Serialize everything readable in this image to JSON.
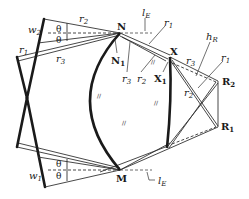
{
  "diagram": {
    "type": "geometric-construction",
    "colors": {
      "ink": "#1a1a1a",
      "thin": "#333333",
      "dashed": "#444444",
      "background": "#ffffff"
    },
    "points": {
      "N": {
        "label": "N",
        "x": 120,
        "y": 33
      },
      "N1": {
        "label": "N",
        "sub": "1",
        "x": 116,
        "y": 36
      },
      "M": {
        "label": "M",
        "x": 120,
        "y": 170
      },
      "X": {
        "label": "X",
        "x": 170,
        "y": 57
      },
      "X1": {
        "label": "X",
        "sub": "1",
        "x": 168,
        "y": 62
      },
      "R1": {
        "label": "R",
        "sub": "1",
        "x": 218,
        "y": 127
      },
      "R2": {
        "label": "R",
        "sub": "2",
        "x": 218,
        "y": 81
      }
    },
    "labels": {
      "N": "N",
      "N1_main": "N",
      "N1_sub": "1",
      "M": "M",
      "X": "X",
      "X1_main": "X",
      "X1_sub": "1",
      "R1_main": "R",
      "R1_sub": "1",
      "R2_main": "R",
      "R2_sub": "2",
      "w1_main": "w",
      "w1_sub": "1",
      "w2_main": "w",
      "w2_sub": "2",
      "theta": "θ",
      "r1_main": "r",
      "r1_sub": "1",
      "r2_main": "r",
      "r2_sub": "2",
      "r3_main": "r",
      "r3_sub": "3",
      "lE_main": "l",
      "lE_sub": "E",
      "hR_main": "h",
      "hR_sub": "R",
      "hatch": "//"
    }
  }
}
